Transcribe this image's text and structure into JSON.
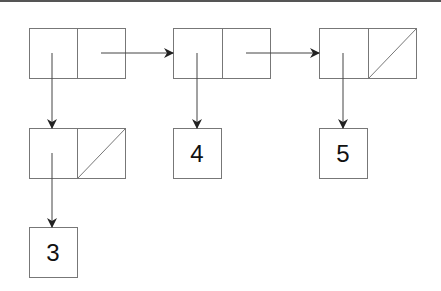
{
  "diagram": {
    "type": "linked-list-box-and-pointer",
    "spine": [
      {
        "id": "pair1",
        "car": "pointer",
        "cdr": "pointer"
      },
      {
        "id": "pair2",
        "car": "pointer",
        "cdr": "pointer"
      },
      {
        "id": "pair3",
        "car": "pointer",
        "cdr": "null"
      }
    ],
    "nested": [
      {
        "id": "pair4",
        "car": "pointer",
        "cdr": "null"
      }
    ],
    "atoms": [
      {
        "id": "atom3",
        "label": "3"
      },
      {
        "id": "atom4",
        "label": "4"
      },
      {
        "id": "atom5",
        "label": "5"
      }
    ],
    "colors": {
      "line": "#666666",
      "arrow": "#222222",
      "text": "#111111"
    }
  }
}
